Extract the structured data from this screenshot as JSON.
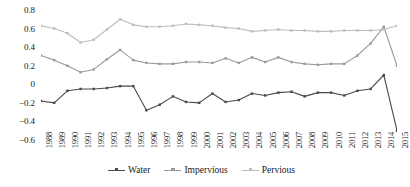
{
  "chart_data": {
    "type": "line",
    "title": "",
    "subtitle": "",
    "xlabel": "",
    "ylabel": "",
    "grid": false,
    "legend_position": "bottom",
    "ylim": [
      -0.6,
      0.8
    ],
    "yticks": [
      "0.8",
      "0.6",
      "0.4",
      "0.2",
      "0",
      "−0.2",
      "−0.4",
      "−0.6"
    ],
    "ytick_values": [
      0.8,
      0.6,
      0.4,
      0.2,
      0,
      -0.2,
      -0.4,
      -0.6
    ],
    "categories": [
      "1988",
      "1989",
      "1990",
      "1991",
      "1992",
      "1993",
      "1994",
      "1995",
      "1996",
      "1997",
      "1998",
      "1999",
      "2000",
      "2001",
      "2002",
      "2003",
      "2004",
      "2005",
      "2006",
      "2007",
      "2008",
      "2009",
      "2010",
      "2011",
      "2012",
      "2013",
      "2014",
      "2015"
    ],
    "series": [
      {
        "name": "Water",
        "color": "#4a4a4a",
        "values": [
          -0.18,
          -0.2,
          -0.07,
          -0.05,
          -0.05,
          -0.04,
          -0.02,
          -0.02,
          -0.28,
          -0.22,
          -0.13,
          -0.19,
          -0.2,
          -0.1,
          -0.19,
          -0.17,
          -0.1,
          -0.12,
          -0.09,
          -0.08,
          -0.13,
          -0.09,
          -0.09,
          -0.12,
          -0.07,
          -0.05,
          0.1,
          -0.5
        ]
      },
      {
        "name": "Impervious",
        "color": "#9a9a9a",
        "values": [
          0.31,
          0.26,
          0.2,
          0.13,
          0.16,
          0.27,
          0.37,
          0.26,
          0.23,
          0.22,
          0.22,
          0.24,
          0.24,
          0.23,
          0.28,
          0.23,
          0.29,
          0.24,
          0.29,
          0.24,
          0.22,
          0.21,
          0.22,
          0.22,
          0.31,
          0.44,
          0.62,
          0.2
        ]
      },
      {
        "name": "Pervious",
        "color": "#bdbdbd",
        "values": [
          0.63,
          0.6,
          0.55,
          0.45,
          0.48,
          0.59,
          0.7,
          0.64,
          0.62,
          0.62,
          0.63,
          0.65,
          0.64,
          0.63,
          0.61,
          0.6,
          0.57,
          0.58,
          0.59,
          0.58,
          0.58,
          0.57,
          0.57,
          0.58,
          0.58,
          0.58,
          0.59,
          0.63
        ]
      }
    ]
  },
  "legend": {
    "items": [
      {
        "label": "Water"
      },
      {
        "label": "Impervious"
      },
      {
        "label": "Pervious"
      }
    ]
  }
}
